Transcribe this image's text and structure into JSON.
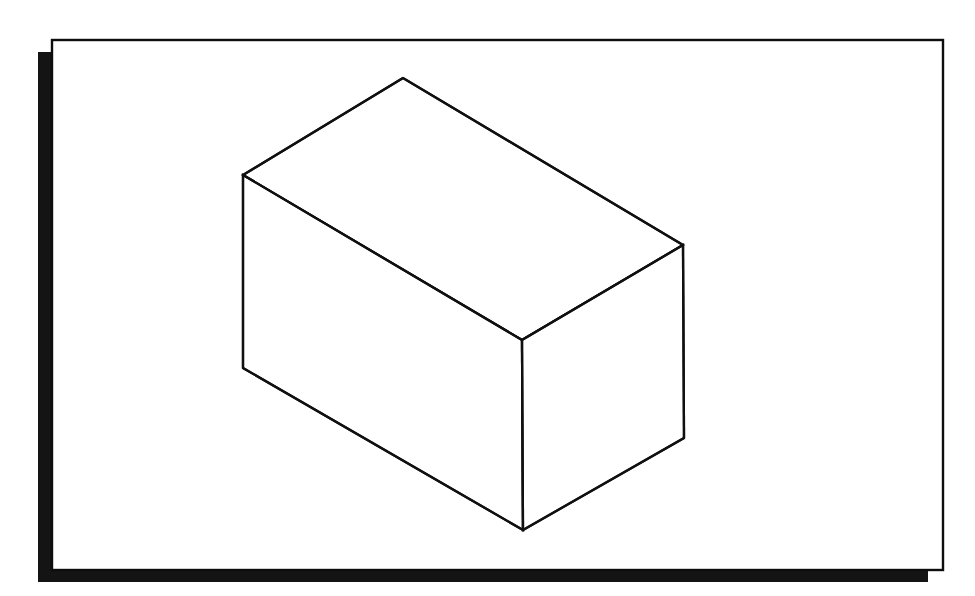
{
  "canvas": {
    "width": 975,
    "height": 596,
    "background_color": "#ffffff",
    "title": "Isometric rectangular box line drawing"
  },
  "frame": {
    "name": "card-frame",
    "shadow": {
      "name": "drop-shadow",
      "color": "#141414",
      "x": 38,
      "y": 52,
      "width": 890,
      "height": 530,
      "offset_x": -14,
      "offset_y": 12
    },
    "border": {
      "name": "frame-outline",
      "stroke_color": "#0d0d0d",
      "fill_color": "#ffffff",
      "stroke_width": 2.4,
      "x": 52,
      "y": 40,
      "width": 891,
      "height": 530
    }
  },
  "figure": {
    "name": "isometric-box",
    "type": "line-drawing",
    "stroke_color": "#101010",
    "fill_color": "#ffffff",
    "stroke_width": 2.3,
    "vertices": {
      "top_apex": [
        403,
        78
      ],
      "top_left": [
        243,
        175
      ],
      "top_right": [
        683,
        245
      ],
      "front_top": [
        522,
        340
      ],
      "bottom_left": [
        243,
        368
      ],
      "bottom_front": [
        523,
        530
      ],
      "bottom_right": [
        684,
        438
      ]
    },
    "faces": [
      {
        "name": "top-face",
        "points": "403,78 243,175 522,340 683,245"
      },
      {
        "name": "left-face",
        "points": "243,175 243,368 523,530 522,340"
      },
      {
        "name": "right-face",
        "points": "522,340 523,530 684,438 683,245"
      }
    ],
    "edges": [
      {
        "name": "edge-top-back-left",
        "points": "403,78 243,175"
      },
      {
        "name": "edge-top-back-right",
        "points": "403,78 683,245"
      },
      {
        "name": "edge-top-front-left",
        "points": "243,175 522,340"
      },
      {
        "name": "edge-top-front-right",
        "points": "522,340 683,245"
      },
      {
        "name": "edge-vertical-left",
        "points": "243,175 243,368"
      },
      {
        "name": "edge-vertical-front",
        "points": "522,340 523,530"
      },
      {
        "name": "edge-vertical-right",
        "points": "683,245 684,438"
      },
      {
        "name": "edge-bottom-left",
        "points": "243,368 523,530"
      },
      {
        "name": "edge-bottom-right",
        "points": "523,530 684,438"
      }
    ]
  }
}
